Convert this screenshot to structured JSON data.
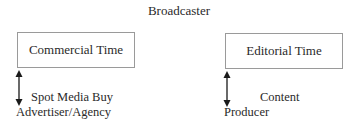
{
  "diagram": {
    "title": "Broadcaster",
    "left": {
      "box_label": "Commercial Time",
      "arrow": "double-headed-vertical-arrow",
      "relation_label": "Spot Media Buy",
      "party_label": "Advertiser/Agency"
    },
    "right": {
      "box_label": "Editorial Time",
      "arrow": "double-headed-vertical-arrow",
      "relation_label": "Content",
      "party_label": "Producer"
    }
  }
}
